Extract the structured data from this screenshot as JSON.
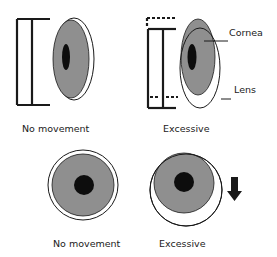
{
  "diagram": {
    "title": "",
    "colors": {
      "cornea_fill": "#8f8f8f",
      "pupil_fill": "#0d0d0d",
      "line": "#1a1a1a",
      "lens_fill": "#ffffff"
    },
    "panels": [
      {
        "id": "side-no-movement",
        "view": "side",
        "caption": "No movement"
      },
      {
        "id": "side-excessive",
        "view": "side",
        "caption": "Excessive",
        "callouts": [
          {
            "label": "Cornea"
          },
          {
            "label": "Lens"
          }
        ]
      },
      {
        "id": "front-no-movement",
        "view": "front",
        "caption": "No movement"
      },
      {
        "id": "front-excessive",
        "view": "front",
        "caption": "Excessive",
        "indicator": "down-arrow"
      }
    ]
  }
}
